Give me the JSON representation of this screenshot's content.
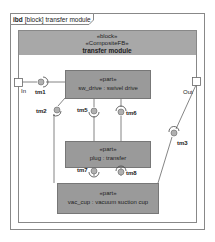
{
  "frame": {
    "kind": "ibd",
    "type": "[block]",
    "name": "transfer module",
    "tab_label": "ibd [block] transfer module"
  },
  "block": {
    "stereotype1": "«block»",
    "stereotype2": "«CompositeFB»",
    "name": "transfer module"
  },
  "parts": [
    {
      "stereotype": "«part»",
      "label": "sw_drive : swivel drive"
    },
    {
      "stereotype": "«part»",
      "label": "plug : transfer"
    },
    {
      "stereotype": "«part»",
      "label": "vac_cup : vacuum suction cup"
    }
  ],
  "boundary_ports": [
    {
      "name": "In"
    },
    {
      "name": "Out"
    }
  ],
  "interfaces": [
    {
      "name": "tm1"
    },
    {
      "name": "tm2"
    },
    {
      "name": "tm3"
    },
    {
      "name": "tm5"
    },
    {
      "name": "tm6"
    },
    {
      "name": "tm7"
    },
    {
      "name": "tm8"
    }
  ],
  "colors": {
    "part_fill": "#9a9a9a",
    "header_fill": "#a8a8a8",
    "ball_fill": "#b0b0b0",
    "line": "#555555"
  }
}
